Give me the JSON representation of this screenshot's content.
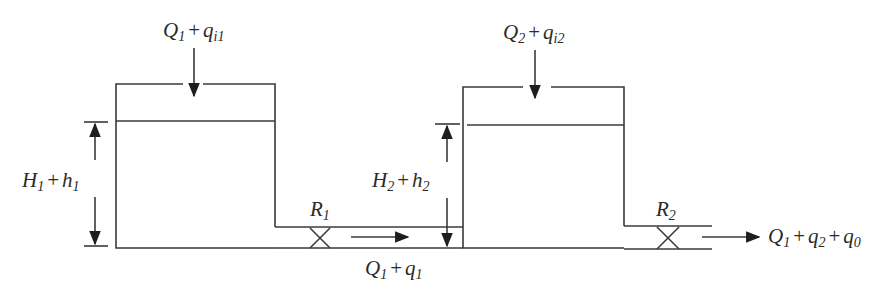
{
  "diagram": {
    "colors": {
      "line": "#3a3a3a",
      "text": "#2a2a2a",
      "background": "#ffffff"
    },
    "labels": {
      "inflow1": {
        "base": "Q",
        "base_sub": "1",
        "op": "+",
        "var": "q",
        "var_sub": "i1"
      },
      "inflow2": {
        "base": "Q",
        "base_sub": "2",
        "op": "+",
        "var": "q",
        "var_sub": "i2"
      },
      "level1": {
        "base": "H",
        "base_sub": "1",
        "op": "+",
        "var": "h",
        "var_sub": "1"
      },
      "level2": {
        "base": "H",
        "base_sub": "2",
        "op": "+",
        "var": "h",
        "var_sub": "2"
      },
      "resistance1": {
        "base": "R",
        "base_sub": "1"
      },
      "resistance2": {
        "base": "R",
        "base_sub": "2"
      },
      "flow12": {
        "base": "Q",
        "base_sub": "1",
        "op": "+",
        "var": "q",
        "var_sub": "1"
      },
      "outflow": {
        "base": "Q",
        "base_sub": "1",
        "op": "+",
        "var": "q",
        "var_sub": "2",
        "op2": "+",
        "var2": "q",
        "var2_sub": "0"
      }
    },
    "components": [
      {
        "id": "tank1",
        "type": "tank"
      },
      {
        "id": "tank2",
        "type": "tank"
      },
      {
        "id": "valve1",
        "type": "valve",
        "label": "R1"
      },
      {
        "id": "valve2",
        "type": "valve",
        "label": "R2"
      }
    ]
  }
}
